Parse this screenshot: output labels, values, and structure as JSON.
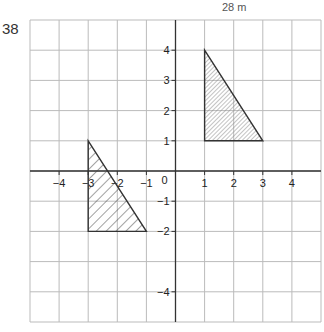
{
  "question_number": "38",
  "top_note": "28 m",
  "grid": {
    "xmin": -5,
    "xmax": 5,
    "ymin": -5,
    "ymax": 5
  },
  "axes": {
    "x_labels": [
      "-4",
      "-3",
      "-2",
      "-1",
      "1",
      "2",
      "3",
      "4"
    ],
    "y_labels": [
      "4",
      "3",
      "2",
      "1",
      "-1",
      "-2",
      "-4"
    ],
    "origin_label": "0"
  },
  "shapes": [
    {
      "name": "triangle-upper-right",
      "vertices": [
        [
          1,
          4
        ],
        [
          1,
          1
        ],
        [
          3,
          1
        ]
      ],
      "hatch": "fine"
    },
    {
      "name": "triangle-lower-left",
      "vertices": [
        [
          -3,
          1
        ],
        [
          -3,
          -2
        ],
        [
          -1,
          -2
        ]
      ],
      "hatch": "coarse"
    }
  ]
}
